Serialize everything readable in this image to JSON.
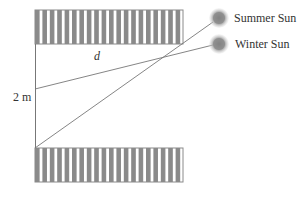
{
  "diagram": {
    "labels": {
      "d": "d",
      "height": "2 m",
      "summer": "Summer Sun",
      "winter": "Winter Sun"
    },
    "colors": {
      "stripe": "#8a8a8a",
      "line": "#777777",
      "sun": "#888888",
      "text": "#333333"
    },
    "overhang": {
      "x": 35,
      "y": 10,
      "width": 148,
      "height": 34
    },
    "floor": {
      "x": 35,
      "y": 148,
      "width": 148,
      "height": 34
    },
    "suns": [
      {
        "name": "Summer Sun",
        "cx": 219,
        "cy": 18
      },
      {
        "name": "Winter Sun",
        "cx": 219,
        "cy": 44
      }
    ]
  }
}
